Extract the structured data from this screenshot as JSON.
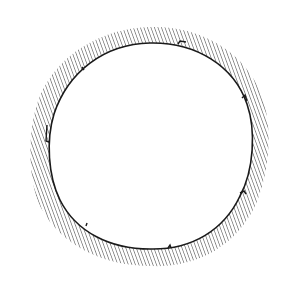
{
  "figure": {
    "canvas": {
      "width": 288,
      "height": 283,
      "background": "#ffffff"
    },
    "ring": {
      "center": [
        150,
        146
      ],
      "outer_radius": 119,
      "inner_radius": 103,
      "hatch": {
        "angle_deg": 70,
        "spacing_px": 3.3,
        "stroke": "#2a2a2a",
        "stroke_width": 0.9
      },
      "inner_edge_stroke": "#1a1a1a",
      "inner_edge_width": 1.6,
      "notch_angles_deg": [
        -72,
        -20,
        38,
        92,
        128,
        176,
        222
      ]
    }
  }
}
